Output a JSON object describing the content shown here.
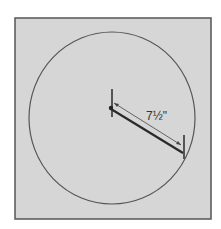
{
  "diagram": {
    "background_color": "#ffffff",
    "panel": {
      "fill": "#d6d6d6",
      "stroke": "#555555"
    },
    "circle": {
      "stroke": "#555555"
    },
    "bar": {
      "color": "#2a2a2a"
    },
    "dimension": {
      "label": "7½\"",
      "line_color": "#444444"
    }
  }
}
